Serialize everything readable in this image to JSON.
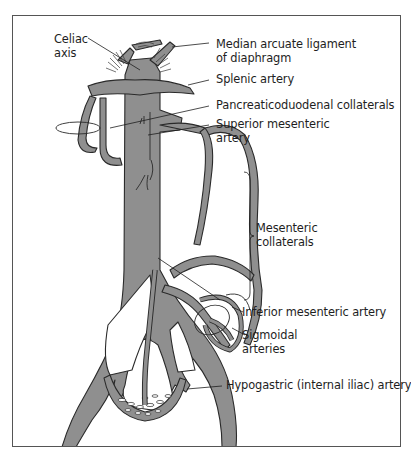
{
  "diagram": {
    "colors": {
      "vessel_fill": "#8f8f8f",
      "vessel_outline": "#2a2a2a",
      "frame": "#555555",
      "text": "#1e1e1e"
    },
    "labels": {
      "celiac_axis": [
        "Celiac",
        "axis"
      ],
      "median_arcuate_ligament": [
        "Median arcuate ligament",
        "of diaphragm"
      ],
      "splenic_artery": [
        "Splenic artery"
      ],
      "pancreaticoduodenal_collaterals": [
        "Pancreaticoduodenal collaterals"
      ],
      "superior_mesenteric_artery": [
        "Superior mesenteric",
        "artery"
      ],
      "mesenteric_collaterals": [
        "Mesenteric",
        "collaterals"
      ],
      "inferior_mesenteric_artery": [
        "Inferior mesenteric artery"
      ],
      "sigmoidal_arteries": [
        "Sigmoidal",
        "arteries"
      ],
      "hypogastric_artery": [
        "Hypogastric (internal iliac) artery"
      ]
    }
  }
}
